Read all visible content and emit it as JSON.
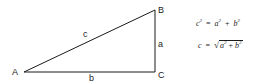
{
  "diagram": {
    "type": "right-triangle",
    "stroke_color": "#1a1a1a",
    "vertices": [
      {
        "id": "A",
        "label": "A",
        "x": 24,
        "y": 72
      },
      {
        "id": "B",
        "label": "B",
        "x": 155,
        "y": 10
      },
      {
        "id": "C",
        "label": "C",
        "x": 155,
        "y": 72
      }
    ],
    "sides": [
      {
        "id": "c",
        "label": "c",
        "from": "A",
        "to": "B"
      },
      {
        "id": "a",
        "label": "a",
        "from": "B",
        "to": "C"
      },
      {
        "id": "b",
        "label": "b",
        "from": "A",
        "to": "C"
      }
    ],
    "right_angle_at": "C"
  },
  "formulas": {
    "pythagorean": {
      "lhs": "c",
      "lhs_exp": "2",
      "eq": "=",
      "t1": "a",
      "t1_exp": "2",
      "plus": "+",
      "t2": "b",
      "t2_exp": "2"
    },
    "hypotenuse": {
      "lhs": "c",
      "eq": "=",
      "radical": "√",
      "t1": "a",
      "t1_exp": "2",
      "plus": "+",
      "t2": "b",
      "t2_exp": "2"
    }
  }
}
